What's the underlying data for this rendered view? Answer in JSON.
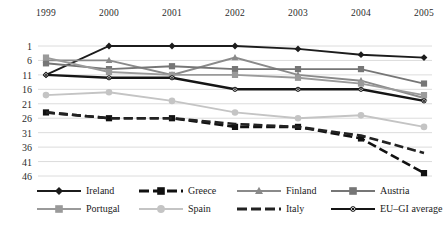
{
  "chart_data": {
    "type": "line",
    "title": "",
    "subtitle": "",
    "xlabel": "",
    "ylabel": "",
    "categories": [
      "1999",
      "2000",
      "2001",
      "2002",
      "2003",
      "2004",
      "2005"
    ],
    "x": [
      1999,
      2000,
      2001,
      2002,
      2003,
      2004,
      2005
    ],
    "yticks": [
      1,
      6,
      11,
      16,
      21,
      26,
      31,
      36,
      41,
      46
    ],
    "ylim": [
      1,
      46
    ],
    "y_axis_inverted": true,
    "grid": true,
    "legend_position": "bottom",
    "legend_columns": 4,
    "series": [
      {
        "name": "Ireland",
        "color": "#1c1c1c",
        "marker": "diamond",
        "dash": "solid",
        "values": [
          11,
          1,
          1,
          1,
          2,
          4,
          5
        ]
      },
      {
        "name": "Greece",
        "color": "#111111",
        "marker": "square",
        "dash": "dashed",
        "values": [
          24,
          26,
          26,
          29,
          29,
          33,
          45
        ]
      },
      {
        "name": "Finland",
        "color": "#8a8a8a",
        "marker": "triangle",
        "dash": "solid",
        "values": [
          6,
          6,
          11,
          5,
          11,
          13,
          19
        ]
      },
      {
        "name": "Austria",
        "color": "#767676",
        "marker": "square",
        "dash": "solid",
        "values": [
          7,
          9,
          8,
          9,
          9,
          9,
          14
        ]
      },
      {
        "name": "Portugal",
        "color": "#9a9a9a",
        "marker": "square",
        "dash": "solid",
        "values": [
          5,
          10,
          11,
          11,
          12,
          14,
          18
        ]
      },
      {
        "name": "Spain",
        "color": "#c4c4c4",
        "marker": "circle",
        "dash": "solid",
        "values": [
          18,
          17,
          20,
          24,
          26,
          25,
          29
        ]
      },
      {
        "name": "Italy",
        "color": "#222222",
        "marker": "none",
        "dash": "dashed",
        "values": [
          24,
          26,
          26,
          28,
          29,
          32,
          38
        ]
      },
      {
        "name": "EU-GI average",
        "color": "#151515",
        "marker": "x",
        "dash": "solid",
        "values": [
          11,
          12,
          12,
          16,
          16,
          16,
          20
        ]
      }
    ]
  },
  "legend": {
    "items": [
      {
        "label": "Ireland"
      },
      {
        "label": "Greece"
      },
      {
        "label": "Finland"
      },
      {
        "label": "Austria"
      },
      {
        "label": "Portugal"
      },
      {
        "label": "Spain"
      },
      {
        "label": "Italy"
      },
      {
        "label": "EU–GI average"
      }
    ]
  }
}
